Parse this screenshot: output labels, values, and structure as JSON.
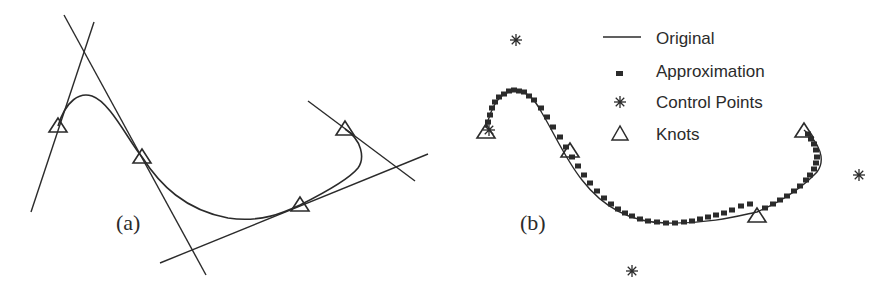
{
  "panel_a": {
    "label": "(a)",
    "curve_path": "M58,126 C66,100 80,92 92,96 C110,102 128,140 142,157 C160,185 185,210 228,218 C262,223 285,212 300,205 C330,190 350,178 358,168 C365,158 362,140 345,129",
    "knots": [
      [
        58,
        126
      ],
      [
        142,
        157
      ],
      [
        300,
        205
      ],
      [
        345,
        129
      ]
    ],
    "tangent_lines": [
      {
        "x1": 31,
        "y1": 212,
        "x2": 94,
        "y2": 22
      },
      {
        "x1": 64,
        "y1": 15,
        "x2": 206,
        "y2": 275
      },
      {
        "x1": 160,
        "y1": 263,
        "x2": 428,
        "y2": 154
      },
      {
        "x1": 308,
        "y1": 101,
        "x2": 415,
        "y2": 181
      }
    ]
  },
  "panel_b": {
    "label": "(b)",
    "curve_path": "M486,128 C492,104 500,92 515,91 C528,91 535,100 542,113 C555,135 566,160 582,180 C602,206 628,222 665,223 C712,224 742,215 757,212 C780,202 800,190 817,172 C826,160 820,143 804,130",
    "control_points": [
      [
        516,
        40
      ],
      [
        632,
        271
      ],
      [
        859,
        175
      ],
      [
        489,
        130
      ]
    ],
    "knots": [
      [
        486,
        132
      ],
      [
        570,
        151
      ],
      [
        757,
        216
      ],
      [
        804,
        131
      ]
    ],
    "approx_markers": [
      [
        488,
        122
      ],
      [
        490,
        115
      ],
      [
        492,
        108
      ],
      [
        495,
        102
      ],
      [
        499,
        97
      ],
      [
        504,
        94
      ],
      [
        509,
        91
      ],
      [
        514,
        90
      ],
      [
        519,
        91
      ],
      [
        524,
        92
      ],
      [
        529,
        96
      ],
      [
        534,
        100
      ],
      [
        541,
        108
      ],
      [
        547,
        117
      ],
      [
        553,
        127
      ],
      [
        560,
        137
      ],
      [
        566,
        147
      ],
      [
        572,
        157
      ],
      [
        578,
        166
      ],
      [
        584,
        175
      ],
      [
        590,
        183
      ],
      [
        597,
        191
      ],
      [
        604,
        198
      ],
      [
        611,
        204
      ],
      [
        618,
        209
      ],
      [
        625,
        213
      ],
      [
        632,
        216
      ],
      [
        640,
        219
      ],
      [
        648,
        221
      ],
      [
        657,
        222
      ],
      [
        666,
        223
      ],
      [
        675,
        223
      ],
      [
        684,
        222
      ],
      [
        692,
        221
      ],
      [
        700,
        219
      ],
      [
        708,
        217
      ],
      [
        716,
        215
      ],
      [
        724,
        213
      ],
      [
        732,
        210
      ],
      [
        741,
        206
      ],
      [
        750,
        204
      ],
      [
        765,
        208
      ],
      [
        773,
        204
      ],
      [
        780,
        200
      ],
      [
        787,
        196
      ],
      [
        794,
        191
      ],
      [
        800,
        186
      ],
      [
        806,
        180
      ],
      [
        810,
        175
      ],
      [
        814,
        169
      ],
      [
        816,
        163
      ],
      [
        817,
        157
      ],
      [
        816,
        150
      ],
      [
        814,
        144
      ],
      [
        811,
        139
      ],
      [
        808,
        134
      ]
    ]
  },
  "chart_data": {
    "type": "diagram",
    "title": "",
    "panels": [
      {
        "label": "(a)",
        "description": "Curve with four knots and tangent lines at each knot"
      },
      {
        "label": "(b)",
        "description": "Original curve vs. approximation with control points and knots"
      }
    ],
    "legend": {
      "position": "upper-right of panel (b)",
      "entries": [
        {
          "label": "Original",
          "marker": "line"
        },
        {
          "label": "Approximation",
          "marker": "filled-square"
        },
        {
          "label": "Control Points",
          "marker": "asterisk"
        },
        {
          "label": "Knots",
          "marker": "triangle"
        }
      ]
    }
  },
  "legend": {
    "original": "Original",
    "approximation": "Approximation",
    "control_points": "Control Points",
    "knots": "Knots"
  },
  "colors": {
    "ink": "#2b2b2b",
    "background": "#ffffff"
  }
}
